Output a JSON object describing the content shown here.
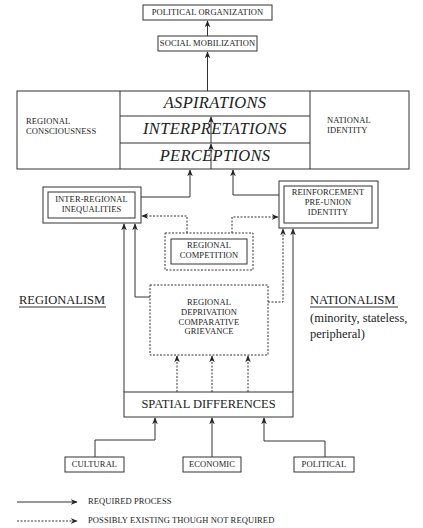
{
  "diagram": {
    "top": {
      "political_organization": "POLITICAL ORGANIZATION",
      "social_mobilization": "SOCIAL MOBILIZATION"
    },
    "central_block": {
      "left": "REGIONAL CONSCIOUSNESS",
      "left_lines": [
        "REGIONAL",
        "CONSCIOUSNESS"
      ],
      "rows": [
        "ASPIRATIONS",
        "INTERPRETATIONS",
        "PERCEPTIONS"
      ],
      "right_lines": [
        "NATIONAL",
        "IDENTITY"
      ]
    },
    "inter_regional": [
      "INTER-REGIONAL",
      "INEQUALITIES"
    ],
    "reinforcement": [
      "REINFORCEMENT",
      "PRE-UNION",
      "IDENTITY"
    ],
    "competition": [
      "REGIONAL",
      "COMPETITION"
    ],
    "deprivation": [
      "REGIONAL",
      "DEPRIVATION",
      "COMPARATIVE",
      "GRIEVANCE"
    ],
    "regionalism": "REGIONALISM",
    "nationalism": "NATIONALISM",
    "nationalism_sub": [
      "(minority, stateless,",
      "peripheral)"
    ],
    "spatial": "SPATIAL DIFFERENCES",
    "sources": [
      "CULTURAL",
      "ECONOMIC",
      "POLITICAL"
    ]
  },
  "legend": {
    "required": "REQUIRED PROCESS",
    "possible": "POSSIBLY EXISTING THOUGH NOT REQUIRED"
  },
  "colors": {
    "line": "#333333",
    "background": "#ffffff"
  }
}
